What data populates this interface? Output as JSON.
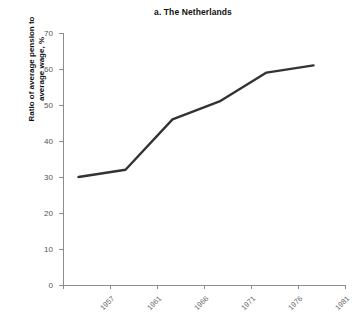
{
  "chart_data": {
    "type": "line",
    "title": "a. The Netherlands",
    "xlabel": "",
    "ylabel": "Ratio of average pension to\naverage wage, %",
    "categories": [
      "1957",
      "1961",
      "1966",
      "1971",
      "1976",
      "1981"
    ],
    "values": [
      30,
      32,
      46,
      51,
      59,
      61
    ],
    "series": [
      {
        "name": "Ratio of average pension to average wage",
        "values": [
          30,
          32,
          46,
          51,
          59,
          61
        ]
      }
    ],
    "ylim": [
      0,
      70
    ],
    "ytick_labels": [
      "0",
      "10",
      "20",
      "30",
      "40",
      "50",
      "60",
      "70"
    ],
    "ytick_values": [
      0,
      10,
      20,
      30,
      40,
      50,
      60,
      70
    ],
    "xtick_labels": [
      "1957",
      "1961",
      "1966",
      "1971",
      "1976",
      "1981"
    ],
    "grid": false,
    "legend": false,
    "legend_position": "none",
    "line_color": "#333333",
    "axis_color": "#8c8c8c",
    "background_color": "#ffffff"
  }
}
